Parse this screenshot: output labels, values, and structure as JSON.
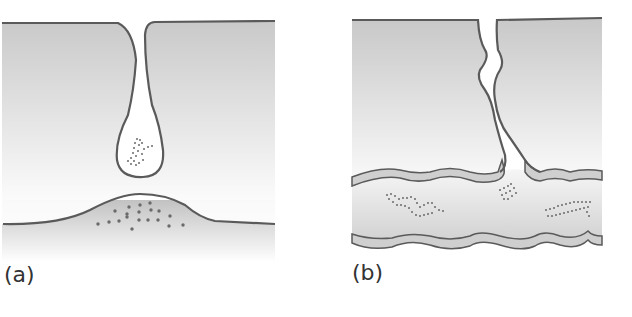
{
  "figure": {
    "panels": [
      {
        "id": "a",
        "label": "(a)",
        "description": "Vesicle containing particles pinching off from a surface invagination above a bulging membrane region with scattered particles"
      },
      {
        "id": "b",
        "label": "(b)",
        "description": "Crack/channel through upper layer opening into a lumen bounded by wavy membrane walls, with particle chains inside"
      }
    ],
    "colors": {
      "outline": "#5a5a5a",
      "fill_dark": "#c8c8c8",
      "fill_light": "#f6f6f6",
      "particle": "#6a6a6a"
    }
  }
}
